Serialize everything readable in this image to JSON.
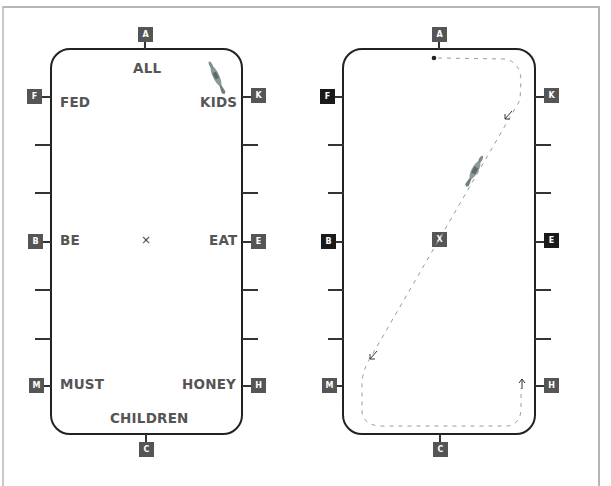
{
  "colors": {
    "arena_border": "#222222",
    "marker_grey": "#555555",
    "marker_dark": "#1a1a1a",
    "word_text": "#555555",
    "path_dash": "#999999",
    "horse": "#8a9a9a"
  },
  "left_diagram": {
    "title": "Dressage arena with memory words",
    "markers": {
      "A": "A",
      "F": "F",
      "K": "K",
      "B": "B",
      "E": "E",
      "M": "M",
      "H": "H",
      "C": "C"
    },
    "words": {
      "top": "ALL",
      "F": "FED",
      "K": "KIDS",
      "B": "BE",
      "E": "EAT",
      "M": "MUST",
      "H": "HONEY",
      "bottom": "CHILDREN"
    },
    "center_mark": "×",
    "icon": "horse-icon"
  },
  "right_diagram": {
    "title": "Dressage arena with ridden path",
    "markers": {
      "A": "A",
      "F": "F",
      "K": "K",
      "B": "B",
      "X": "X",
      "E": "E",
      "M": "M",
      "H": "H",
      "C": "C"
    },
    "highlighted_markers": [
      "F",
      "B",
      "E"
    ],
    "path": "dashed line from start dot near A, through K corner, diagonal across X to M, along C end to H",
    "arrows": [
      "down-left near K",
      "down-left near M",
      "up near H"
    ],
    "icon": "horse-icon"
  }
}
